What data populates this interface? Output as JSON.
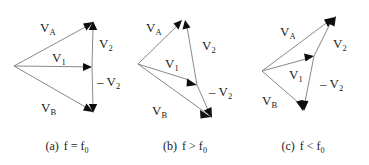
{
  "figure": {
    "background_color": "#ffffff",
    "line_color": "#7a7a7a",
    "arrowhead_color": "#0d0d0d",
    "text_color": "#1a1a1a",
    "panels": [
      {
        "id": "a",
        "caption_prefix": "(a)",
        "caption_body": "f = f",
        "caption_sub": "0",
        "condition": "f = f0",
        "description": "Symmetric isosceles triangle; V1 horizontal, V2 and -V2 vertical and equal",
        "vertices": {
          "apex": [
            14,
            66
          ],
          "top": [
            93,
            22
          ],
          "bottom": [
            93,
            112
          ],
          "v1_tip": [
            92,
            67
          ]
        },
        "labels": {
          "va": "V",
          "va_sub": "A",
          "vb": "V",
          "vb_sub": "B",
          "v1": "V",
          "v1_sub": "1",
          "v2": "V",
          "v2_sub": "2",
          "nv2": "– V",
          "nv2_sub": "2"
        }
      },
      {
        "id": "b",
        "caption_prefix": "(b)",
        "caption_body": "f > f",
        "caption_sub": "0",
        "condition": "f > f0",
        "description": "Triangle rotated clockwise; resultant V1 tilts downward to the right",
        "vertices": {
          "apex": [
            138,
            64
          ],
          "top": [
            182,
            20
          ],
          "bottom": [
            211,
            117
          ],
          "v1_tip": [
            196,
            84
          ]
        },
        "labels": {
          "va": "V",
          "va_sub": "A",
          "vb": "V",
          "vb_sub": "B",
          "v1": "V",
          "v1_sub": "1",
          "v2": "V",
          "v2_sub": "2",
          "nv2": "– V",
          "nv2_sub": "2"
        }
      },
      {
        "id": "c",
        "caption_prefix": "(c)",
        "caption_body": "f < f",
        "caption_sub": "0",
        "condition": "f < f0",
        "description": "Triangle rotated counter-clockwise; resultant V1 tilts upward to the right",
        "vertices": {
          "apex": [
            262,
            71
          ],
          "top": [
            335,
            17
          ],
          "bottom": [
            304,
            110
          ],
          "v1_tip": [
            313,
            57
          ]
        },
        "labels": {
          "va": "V",
          "va_sub": "A",
          "vb": "V",
          "vb_sub": "B",
          "v1": "V",
          "v1_sub": "1",
          "v2": "V",
          "v2_sub": "2",
          "nv2": "– V",
          "nv2_sub": "2"
        }
      }
    ]
  }
}
